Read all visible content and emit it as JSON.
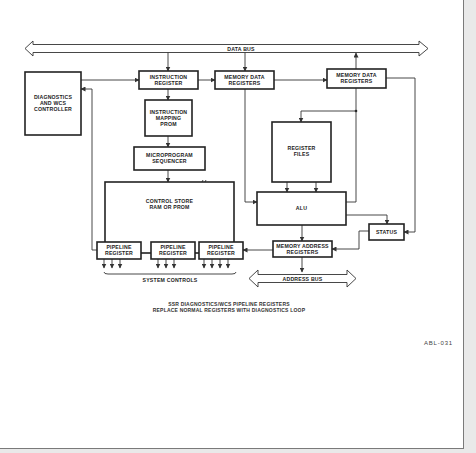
{
  "diagram": {
    "data_bus_label": "DATA BUS",
    "address_bus_label": "ADDRESS BUS",
    "blocks": {
      "diagnostics": [
        "DIAGNOSTICS",
        "AND WCS",
        "CONTROLLER"
      ],
      "instruction_register": [
        "INSTRUCTION",
        "REGISTER"
      ],
      "memory_data_registers_1": [
        "MEMORY DATA",
        "REGISTERS"
      ],
      "memory_data_registers_2": [
        "MEMORY DATA",
        "REGISTERS"
      ],
      "instruction_mapping_prom": [
        "INSTRUCTION",
        "MAPPING",
        "PROM"
      ],
      "microprogram_sequencer": [
        "MICROPROGRAM",
        "SEQUENCER"
      ],
      "control_store": [
        "CONTROL STORE",
        "RAM OR PROM"
      ],
      "register_files": [
        "REGISTER",
        "FILES"
      ],
      "alu": [
        "ALU"
      ],
      "status": [
        "STATUS"
      ],
      "memory_address_registers": [
        "MEMORY ADDRESS",
        "REGISTERS"
      ],
      "pipeline_register_1": [
        "PIPELINE",
        "REGISTER"
      ],
      "pipeline_register_2": [
        "PIPELINE",
        "REGISTER"
      ],
      "pipeline_register_3": [
        "PIPELINE",
        "REGISTER"
      ]
    },
    "system_controls_label": "SYSTEM CONTROLS",
    "caption": [
      "SSR DIAGNOSTICS/WCS PIPELINE REGISTERS",
      "REPLACE NORMAL REGISTERS WITH DIAGNOSTICS LOOP"
    ],
    "figure_ref": "ABL-031"
  }
}
